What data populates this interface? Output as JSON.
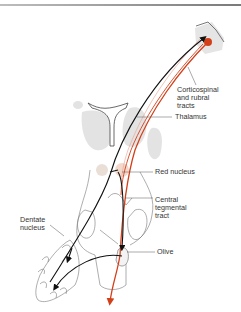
{
  "diagram": {
    "type": "neuroanatomy-pathway",
    "labels": {
      "corticospinal": "Corticospinal\nand rubral\ntracts",
      "thalamus": "Thalamus",
      "red_nucleus": "Red nucleus",
      "central_tegmental": "Central\ntegmental\ntract",
      "dentate": "Dentate\nnucleus",
      "olive": "Olive"
    },
    "colors": {
      "pathway_black": "#111111",
      "pathway_red": "#d2401a",
      "structure_gray": "#e3e3e3",
      "outline": "#666666",
      "red_nucleus_tint": "#f2d9cc"
    }
  }
}
